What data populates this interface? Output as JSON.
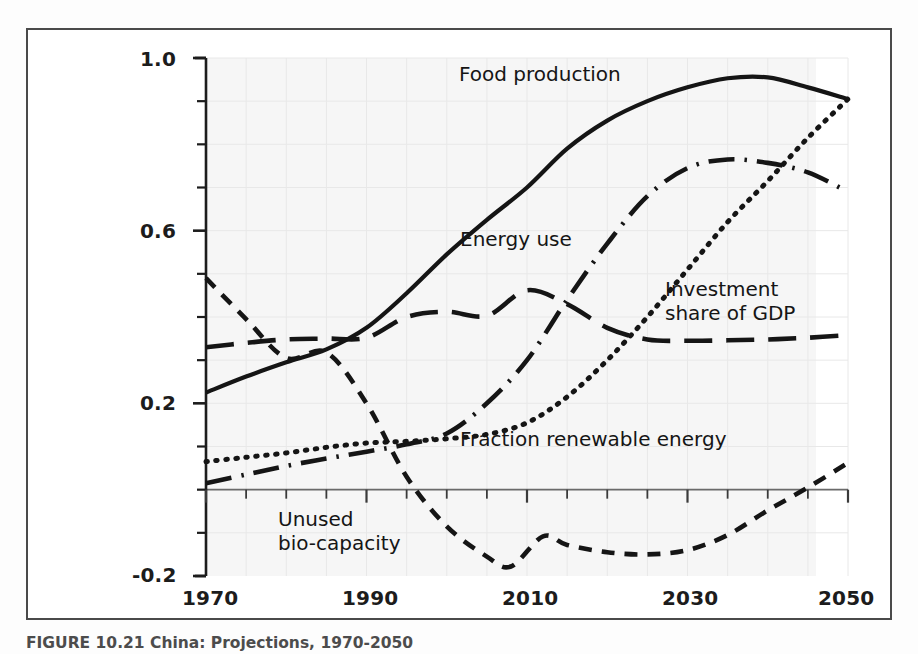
{
  "figure": {
    "caption": "FIGURE 10.21  China: Projections, 1970-2050",
    "frame_color": "#4a4a4a",
    "background_color": "#ffffff",
    "ink_color": "#151515",
    "grid_color": "#e8e8e8",
    "grid_tint_color": "#f2f2f2"
  },
  "axes": {
    "y_tick_labels": [
      "1.0",
      "0.6",
      "0.2",
      "-0.2"
    ],
    "x_tick_labels": [
      "1970",
      "1990",
      "2010",
      "2030",
      "2050"
    ]
  },
  "labels": {
    "food_production": "Food production",
    "energy_use": "Energy use",
    "investment_line1": "Investment",
    "investment_line2": "share of GDP",
    "fraction_renewable": "Fraction renewable energy",
    "unused_line1": "Unused",
    "unused_line2": "bio-capacity"
  },
  "chart_data": {
    "type": "line",
    "title": "China: Projections, 1970-2050",
    "xlabel": "",
    "ylabel": "",
    "xlim": [
      1970,
      2050
    ],
    "ylim": [
      -0.2,
      1.0
    ],
    "xticks": [
      1970,
      1990,
      2010,
      2030,
      2050
    ],
    "yticks": [
      -0.2,
      0.2,
      0.6,
      1.0
    ],
    "y_minor_tick_step": 0.1,
    "x_minor_tick_step": 5,
    "grid": true,
    "legend": "inline-annotations",
    "zero_line": true,
    "series": [
      {
        "name": "Food production",
        "linestyle": "solid",
        "color": "#151515",
        "x": [
          1970,
          1975,
          1980,
          1985,
          1990,
          1995,
          2000,
          2005,
          2010,
          2015,
          2020,
          2025,
          2030,
          2035,
          2040,
          2045,
          2050
        ],
        "values": [
          0.225,
          0.262,
          0.295,
          0.325,
          0.375,
          0.455,
          0.545,
          0.625,
          0.7,
          0.79,
          0.855,
          0.9,
          0.932,
          0.953,
          0.955,
          0.932,
          0.905
        ]
      },
      {
        "name": "Energy use",
        "linestyle": "dashdot",
        "color": "#151515",
        "x": [
          1970,
          1975,
          1980,
          1985,
          1990,
          1995,
          2000,
          2005,
          2010,
          2015,
          2020,
          2025,
          2030,
          2035,
          2040,
          2045,
          2050
        ],
        "values": [
          0.015,
          0.035,
          0.055,
          0.072,
          0.088,
          0.105,
          0.13,
          0.2,
          0.3,
          0.44,
          0.57,
          0.68,
          0.745,
          0.765,
          0.757,
          0.735,
          0.69
        ]
      },
      {
        "name": "Investment share of GDP",
        "linestyle": "longdash",
        "color": "#151515",
        "x": [
          1970,
          1975,
          1980,
          1985,
          1990,
          1995,
          2000,
          2005,
          2010,
          2015,
          2020,
          2025,
          2030,
          2035,
          2040,
          2045,
          2050
        ],
        "values": [
          0.33,
          0.34,
          0.348,
          0.35,
          0.352,
          0.4,
          0.412,
          0.403,
          0.462,
          0.43,
          0.375,
          0.348,
          0.345,
          0.346,
          0.348,
          0.352,
          0.358
        ]
      },
      {
        "name": "Fraction renewable energy",
        "linestyle": "dotted",
        "color": "#151515",
        "x": [
          1970,
          1975,
          1980,
          1985,
          1990,
          1995,
          2000,
          2005,
          2010,
          2015,
          2020,
          2025,
          2030,
          2035,
          2040,
          2045,
          2050
        ],
        "values": [
          0.065,
          0.075,
          0.085,
          0.098,
          0.108,
          0.112,
          0.118,
          0.128,
          0.155,
          0.215,
          0.3,
          0.4,
          0.51,
          0.62,
          0.715,
          0.815,
          0.905
        ]
      },
      {
        "name": "Unused bio-capacity",
        "linestyle": "shortdash",
        "color": "#151515",
        "x": [
          1970,
          1975,
          1980,
          1985,
          1990,
          1995,
          2000,
          2005,
          2008,
          2012,
          2015,
          2020,
          2025,
          2030,
          2035,
          2040,
          2045,
          2050
        ],
        "values": [
          0.49,
          0.395,
          0.305,
          0.318,
          0.2,
          0.03,
          -0.085,
          -0.155,
          -0.178,
          -0.108,
          -0.128,
          -0.145,
          -0.15,
          -0.14,
          -0.105,
          -0.048,
          0.005,
          0.062
        ]
      }
    ]
  }
}
